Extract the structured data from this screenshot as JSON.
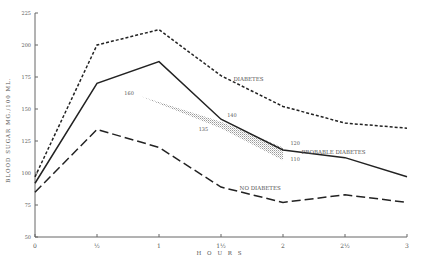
{
  "chart_data": {
    "type": "line",
    "title": "",
    "xlabel": "H O U R S",
    "ylabel": "BLOOD SUGAR MG./100 ML.",
    "xlim": [
      0,
      3
    ],
    "ylim": [
      50,
      225
    ],
    "x_ticks": [
      {
        "value": 0,
        "label": "0"
      },
      {
        "value": 0.5,
        "label": "1/2"
      },
      {
        "value": 1,
        "label": "1"
      },
      {
        "value": 1.5,
        "label": "1 1/2"
      },
      {
        "value": 2,
        "label": "2"
      },
      {
        "value": 2.5,
        "label": "2 1/2"
      },
      {
        "value": 3,
        "label": "3"
      }
    ],
    "y_ticks": [
      50,
      75,
      100,
      125,
      150,
      175,
      200,
      225
    ],
    "grid": false,
    "x": [
      0,
      0.5,
      1,
      1.5,
      2,
      2.5,
      3
    ],
    "series": [
      {
        "name": "DIABETES",
        "style": "short-dash",
        "values": [
          97,
          200,
          212,
          176,
          152,
          139,
          135
        ]
      },
      {
        "name": "PROBABLE DIABETES",
        "style": "solid",
        "values": [
          92,
          170,
          187,
          142,
          118,
          112,
          97
        ]
      },
      {
        "name": "NO DIABETES",
        "style": "long-dash",
        "values": [
          85,
          134,
          120,
          89,
          77,
          83,
          77
        ]
      }
    ],
    "shaded_band": {
      "description": "stippled range band between probable diabetes limits",
      "upper": [
        {
          "x": 0.85,
          "y": 160
        },
        {
          "x": 1.5,
          "y": 140
        },
        {
          "x": 2,
          "y": 120
        }
      ],
      "lower": [
        {
          "x": 0.85,
          "y": 160
        },
        {
          "x": 1.5,
          "y": 135
        },
        {
          "x": 2,
          "y": 110
        }
      ]
    },
    "annotations": [
      {
        "text": "DIABETES",
        "x": 1.6,
        "y": 172
      },
      {
        "text": "PROBABLE DIABETES",
        "x": 2.15,
        "y": 115
      },
      {
        "text": "NO DIABETES",
        "x": 1.65,
        "y": 87
      },
      {
        "text": "160",
        "x": 0.72,
        "y": 161
      },
      {
        "text": "140",
        "x": 1.55,
        "y": 144
      },
      {
        "text": "135",
        "x": 1.32,
        "y": 133
      },
      {
        "text": "120",
        "x": 2.06,
        "y": 122
      },
      {
        "text": "110",
        "x": 2.06,
        "y": 109
      }
    ]
  }
}
